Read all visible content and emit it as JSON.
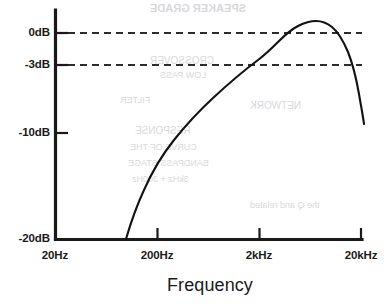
{
  "chart_data": {
    "type": "line",
    "title": "",
    "xlabel": "Frequency",
    "ylabel": "",
    "log_x": true,
    "grid": false,
    "legend": null,
    "xticks": [
      {
        "label": "20Hz",
        "value": 20,
        "px": 55
      },
      {
        "label": "200Hz",
        "value": 200,
        "px": 157
      },
      {
        "label": "2kHz",
        "value": 2000,
        "px": 259
      },
      {
        "label": "20kHz",
        "value": 20000,
        "px": 361
      }
    ],
    "yticks": [
      {
        "label": "0dB",
        "value": 0,
        "px": 33
      },
      {
        "label": "-3dB",
        "value": -3,
        "px": 65
      },
      {
        "label": "-10dB",
        "value": -10,
        "px": 133
      },
      {
        "label": "-20dB",
        "value": -20,
        "px": 239
      }
    ],
    "ylim": [
      -20,
      2.5
    ],
    "xlim": [
      20,
      20000
    ],
    "reference_lines": [
      {
        "label": "0dB",
        "value": 0,
        "style": "dashed"
      },
      {
        "label": "-3dB",
        "value": -3,
        "style": "dashed"
      }
    ],
    "series": [
      {
        "name": "response",
        "points": [
          {
            "freq": 80,
            "db": -20.0
          },
          {
            "freq": 100,
            "db": -16.2
          },
          {
            "freq": 130,
            "db": -12.6
          },
          {
            "freq": 170,
            "db": -9.6
          },
          {
            "freq": 230,
            "db": -7.0
          },
          {
            "freq": 320,
            "db": -5.0
          },
          {
            "freq": 450,
            "db": -3.4
          },
          {
            "freq": 600,
            "db": -2.2
          },
          {
            "freq": 820,
            "db": -1.2
          },
          {
            "freq": 1100,
            "db": -0.4
          },
          {
            "freq": 1500,
            "db": 0.5
          },
          {
            "freq": 2000,
            "db": 1.2
          },
          {
            "freq": 2600,
            "db": 1.6
          },
          {
            "freq": 3400,
            "db": 1.4
          },
          {
            "freq": 4400,
            "db": 0.8
          },
          {
            "freq": 5600,
            "db": -0.3
          },
          {
            "freq": 7200,
            "db": -1.8
          },
          {
            "freq": 9200,
            "db": -3.4
          },
          {
            "freq": 11500,
            "db": -5.2
          },
          {
            "freq": 14000,
            "db": -6.8
          },
          {
            "freq": 17000,
            "db": -8.0
          },
          {
            "freq": 20000,
            "db": -8.6
          }
        ]
      }
    ],
    "annotations": []
  },
  "axis": {
    "frequency_title": "Frequency"
  },
  "bleed_text": [
    {
      "text": "SPEAKER GRADE",
      "x": 150,
      "y": 2,
      "size": 11,
      "weight": "700"
    },
    {
      "text": "CROSSOVER",
      "x": 150,
      "y": 55,
      "size": 10,
      "weight": "400"
    },
    {
      "text": "LOW PASS",
      "x": 160,
      "y": 70,
      "size": 9,
      "weight": "400"
    },
    {
      "text": "FILTER",
      "x": 120,
      "y": 95,
      "size": 9,
      "weight": "400"
    },
    {
      "text": "NETWORK",
      "x": 250,
      "y": 100,
      "size": 10,
      "weight": "400"
    },
    {
      "text": "RESPONSE",
      "x": 135,
      "y": 125,
      "size": 10,
      "weight": "400"
    },
    {
      "text": "CURVE OF THE",
      "x": 130,
      "y": 142,
      "size": 9,
      "weight": "400"
    },
    {
      "text": "BANDPASS STAGE",
      "x": 128,
      "y": 158,
      "size": 9,
      "weight": "400"
    },
    {
      "text": "3kHz + 300Hz",
      "x": 132,
      "y": 174,
      "size": 9,
      "weight": "400"
    },
    {
      "text": "the Q and related",
      "x": 250,
      "y": 200,
      "size": 9,
      "weight": "400"
    }
  ]
}
